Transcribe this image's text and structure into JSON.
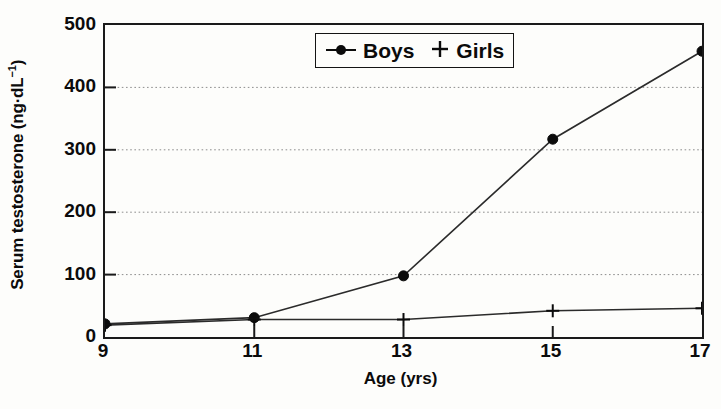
{
  "chart_data": {
    "type": "line",
    "title": "",
    "xlabel": "Age (yrs)",
    "ylabel": "Serum testosterone (ng·dL⁻¹)",
    "ylabel_base": "Serum testosterone (ng·dL",
    "ylabel_sup": "−1",
    "ylabel_tail": ")",
    "x": [
      9,
      11,
      13,
      15,
      17
    ],
    "xtick_labels": [
      "9",
      "11",
      "13",
      "15",
      "17"
    ],
    "ytick_labels": [
      "0",
      "100",
      "200",
      "300",
      "400",
      "500"
    ],
    "ytick_values": [
      0,
      100,
      200,
      300,
      400,
      500
    ],
    "xlim": [
      9,
      17
    ],
    "ylim": [
      0,
      500
    ],
    "grid": "horizontal-dotted",
    "legend_position": "top-center-inside",
    "series": [
      {
        "name": "Boys",
        "marker": "filled-circle",
        "values": [
          21,
          31,
          98,
          317,
          458
        ]
      },
      {
        "name": "Girls",
        "marker": "plus",
        "values": [
          19,
          28,
          28,
          42,
          46
        ]
      }
    ],
    "legend": [
      {
        "label": "Boys",
        "marker": "filled-circle"
      },
      {
        "label": "Girls",
        "marker": "plus"
      }
    ]
  },
  "colors": {
    "ink": "#0b0b0b",
    "axis": "#1a1a1a",
    "grid": "#8d8d8d",
    "series_line": "#2b2b2b",
    "background": "#fdfdfb"
  }
}
